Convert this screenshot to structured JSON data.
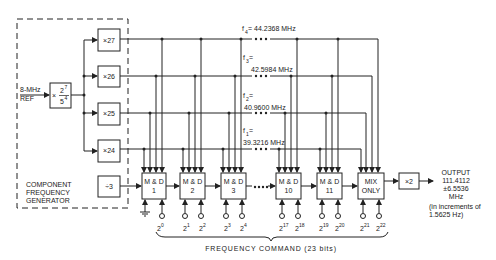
{
  "reference": {
    "line1": "8-MHz",
    "line2": "REF"
  },
  "prescaler": {
    "prefix": "×",
    "numerator": "2",
    "num_exp": "7",
    "denominator": "5",
    "den_exp": "4"
  },
  "multipliers": [
    {
      "label": "×27"
    },
    {
      "label": "×26"
    },
    {
      "label": "×25"
    },
    {
      "label": "×24"
    }
  ],
  "divider": {
    "label": "÷3"
  },
  "generator_label": [
    "COMPONENT",
    "FREQUENCY",
    "GENERATOR"
  ],
  "frequencies": [
    {
      "name": "f",
      "sub": "4",
      "eq": " = 44.2368 MHz"
    },
    {
      "name": "f",
      "sub": "3",
      "eq": " =",
      "value": "42.5984 MHz"
    },
    {
      "name": "f",
      "sub": "2",
      "eq": " =",
      "value": "40.9600 MHz"
    },
    {
      "name": "f",
      "sub": "1",
      "eq": " =",
      "value": "39.3216 MHz"
    }
  ],
  "stages": [
    {
      "line1": "M & D",
      "line2": "1",
      "bits": [
        "",
        "0"
      ]
    },
    {
      "line1": "M & D",
      "line2": "2",
      "bits": [
        "1",
        "2"
      ]
    },
    {
      "line1": "M & D",
      "line2": "3",
      "bits": [
        "3",
        "4"
      ]
    },
    {
      "line1": "M & D",
      "line2": "10",
      "bits": [
        "17",
        "18"
      ]
    },
    {
      "line1": "M & D",
      "line2": "11",
      "bits": [
        "19",
        "20"
      ]
    },
    {
      "line1": "MIX",
      "line2": "ONLY",
      "bits": [
        "21",
        "22"
      ]
    }
  ],
  "doubler": {
    "label": "×2"
  },
  "output": {
    "lines": [
      "OUTPUT",
      "111.4112",
      "±6.5536",
      "MHz"
    ],
    "note": [
      "(in increments of",
      "1.5625 Hz)"
    ]
  },
  "command": {
    "label": "FREQUENCY COMMAND (23 bits)"
  },
  "ellipsis": "••••"
}
